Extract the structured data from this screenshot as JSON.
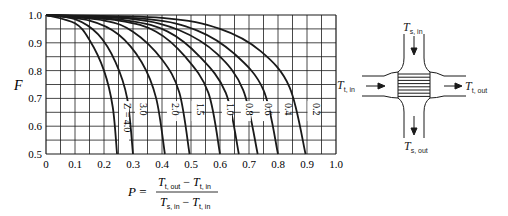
{
  "chart_data": {
    "type": "line",
    "xlabel": "P",
    "ylabel": "F",
    "xlim": [
      0.0,
      1.0
    ],
    "ylim": [
      0.5,
      1.0
    ],
    "grid": true,
    "x_ticks": [
      "0",
      "0.1",
      "0.2",
      "0.3",
      "0.4",
      "0.5",
      "0.6",
      "0.7",
      "0.8",
      "0.9",
      "1.0"
    ],
    "y_ticks": [
      "0.5",
      "0.6",
      "0.7",
      "0.8",
      "0.9",
      "1.0"
    ],
    "x_formula": {
      "lhs": "P",
      "numerator": [
        "T",
        "t, out",
        " − ",
        "T",
        "t, in"
      ],
      "denominator": [
        "T",
        "s, in",
        " − ",
        "T",
        "t, in"
      ]
    },
    "series": [
      {
        "name": "Z = 4.0",
        "label": "Z = 4.0",
        "x": [
          0.0,
          0.1,
          0.15,
          0.2,
          0.23,
          0.245
        ],
        "y": [
          1.0,
          0.97,
          0.91,
          0.8,
          0.67,
          0.5
        ]
      },
      {
        "name": "3.0",
        "label": "3.0",
        "x": [
          0.0,
          0.1,
          0.18,
          0.24,
          0.28,
          0.3
        ],
        "y": [
          1.0,
          0.985,
          0.93,
          0.83,
          0.7,
          0.5
        ]
      },
      {
        "name": "2.0",
        "label": "2.0",
        "x": [
          0.0,
          0.15,
          0.25,
          0.33,
          0.38,
          0.41
        ],
        "y": [
          1.0,
          0.98,
          0.93,
          0.83,
          0.7,
          0.5
        ]
      },
      {
        "name": "1.5",
        "label": "1.5",
        "x": [
          0.0,
          0.2,
          0.3,
          0.4,
          0.46,
          0.495
        ],
        "y": [
          1.0,
          0.98,
          0.94,
          0.84,
          0.72,
          0.5
        ]
      },
      {
        "name": "1.0",
        "label": "1.0",
        "x": [
          0.0,
          0.25,
          0.38,
          0.48,
          0.56,
          0.6
        ],
        "y": [
          1.0,
          0.98,
          0.94,
          0.85,
          0.72,
          0.5
        ]
      },
      {
        "name": "0.8",
        "label": "0.8",
        "x": [
          0.0,
          0.28,
          0.42,
          0.53,
          0.62,
          0.665
        ],
        "y": [
          1.0,
          0.98,
          0.94,
          0.85,
          0.72,
          0.5
        ]
      },
      {
        "name": "0.6",
        "label": "0.6",
        "x": [
          0.0,
          0.3,
          0.46,
          0.59,
          0.68,
          0.73
        ],
        "y": [
          1.0,
          0.985,
          0.945,
          0.86,
          0.73,
          0.5
        ]
      },
      {
        "name": "0.4",
        "label": "0.4",
        "x": [
          0.0,
          0.35,
          0.52,
          0.65,
          0.75,
          0.8
        ],
        "y": [
          1.0,
          0.985,
          0.945,
          0.86,
          0.73,
          0.5
        ]
      },
      {
        "name": "0.2",
        "label": "0.2",
        "x": [
          0.0,
          0.4,
          0.6,
          0.74,
          0.84,
          0.895
        ],
        "y": [
          1.0,
          0.99,
          0.95,
          0.87,
          0.74,
          0.5
        ]
      }
    ]
  },
  "diagram": {
    "shell_in": {
      "main": "T",
      "sub": "s, in"
    },
    "shell_out": {
      "main": "T",
      "sub": "s, out"
    },
    "tube_in": {
      "main": "T",
      "sub": "t, in"
    },
    "tube_out": {
      "main": "T",
      "sub": "t, out"
    }
  },
  "colors": {
    "ink": "#1a1a1a",
    "background": "#ffffff"
  }
}
